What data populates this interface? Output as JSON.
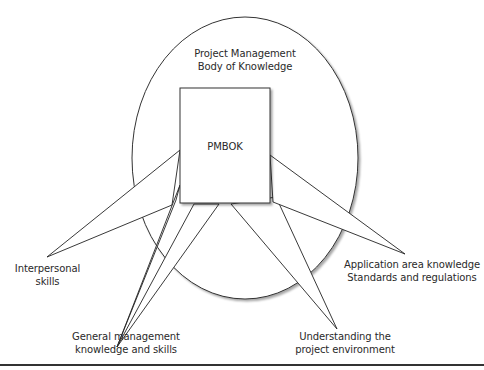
{
  "diagram": {
    "container_label": [
      "Project Management",
      "Body of Knowledge"
    ],
    "core_label": "PMBOK",
    "spokes": [
      {
        "id": "interpersonal",
        "lines": [
          "Interpersonal",
          "skills"
        ]
      },
      {
        "id": "general-management",
        "lines": [
          "General management",
          "knowledge and skills"
        ]
      },
      {
        "id": "project-environment",
        "lines": [
          "Understanding the",
          "project environment"
        ]
      },
      {
        "id": "application-area",
        "lines": [
          "Application area knowledge",
          "Standards and regulations"
        ]
      }
    ]
  }
}
